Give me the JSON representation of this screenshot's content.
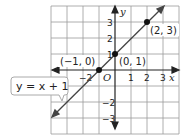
{
  "diagram": {
    "type": "coordinate-graph",
    "equation_label": "y = x + 1",
    "axes": {
      "x_label": "x",
      "y_label": "y",
      "origin_label": "O",
      "x_ticks": [
        {
          "value": -2,
          "label": "−2"
        },
        {
          "value": 1,
          "label": "1"
        },
        {
          "value": 2,
          "label": "2"
        },
        {
          "value": 3,
          "label": "3"
        }
      ],
      "y_ticks": [
        {
          "value": 3,
          "label": "3"
        },
        {
          "value": 2,
          "label": "2"
        },
        {
          "value": 1,
          "label": "1"
        },
        {
          "value": -2,
          "label": "−2"
        },
        {
          "value": -3,
          "label": "−3"
        }
      ],
      "grid_range": {
        "x": [
          -4,
          4
        ],
        "y": [
          -4,
          4
        ]
      }
    },
    "points": [
      {
        "x": -1,
        "y": 0,
        "label": "(−1, 0)"
      },
      {
        "x": 0,
        "y": 1,
        "label": "(0, 1)"
      },
      {
        "x": 2,
        "y": 3,
        "label": "(2, 3)"
      }
    ],
    "colors": {
      "grid": "#9a9a9a",
      "axis": "#222222",
      "line": "#444444",
      "point": "#111111",
      "callout_border": "#aaaaaa"
    }
  }
}
